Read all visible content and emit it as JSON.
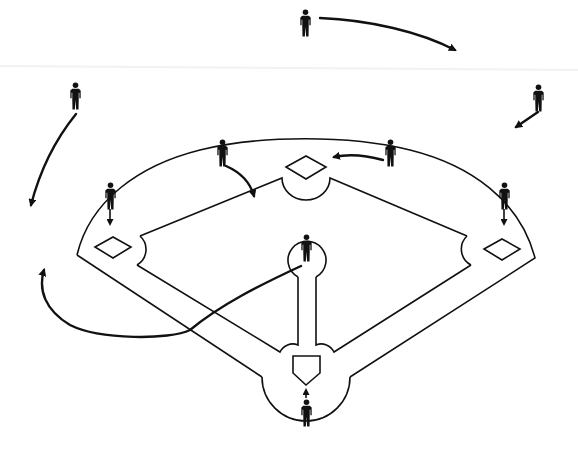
{
  "diagram": {
    "title": "",
    "type": "baseball-field-defensive-positions",
    "colors": {
      "line": "#111111",
      "background": "#ffffff"
    },
    "bases": [
      {
        "name": "home-plate",
        "x": 306,
        "y": 372
      },
      {
        "name": "first-base",
        "x": 502,
        "y": 249
      },
      {
        "name": "second-base",
        "x": 306,
        "y": 167
      },
      {
        "name": "third-base",
        "x": 113,
        "y": 247
      }
    ],
    "players": [
      {
        "name": "pitcher",
        "x": 306,
        "y": 250
      },
      {
        "name": "catcher",
        "x": 306,
        "y": 410
      },
      {
        "name": "first-baseman",
        "x": 504,
        "y": 196
      },
      {
        "name": "second-baseman",
        "x": 390,
        "y": 153
      },
      {
        "name": "shortstop",
        "x": 222,
        "y": 153
      },
      {
        "name": "third-baseman",
        "x": 110,
        "y": 196
      },
      {
        "name": "left-fielder",
        "x": 75,
        "y": 95
      },
      {
        "name": "center-fielder",
        "x": 306,
        "y": 25
      },
      {
        "name": "right-fielder",
        "x": 539,
        "y": 96
      }
    ],
    "movements": [
      {
        "player": "center-fielder",
        "direction": "right"
      },
      {
        "player": "left-fielder",
        "direction": "down-left"
      },
      {
        "player": "right-fielder",
        "direction": "down-left"
      },
      {
        "player": "second-baseman",
        "direction": "toward-second-base"
      },
      {
        "player": "shortstop",
        "direction": "toward-infield"
      },
      {
        "player": "third-baseman",
        "direction": "down"
      },
      {
        "player": "first-baseman",
        "direction": "down"
      },
      {
        "player": "catcher",
        "direction": "up"
      },
      {
        "player": "pitcher",
        "direction": "toward-left-foul-area"
      }
    ]
  }
}
